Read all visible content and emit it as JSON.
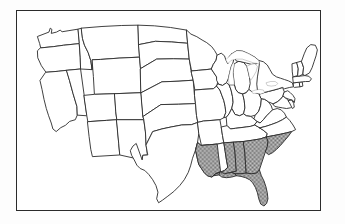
{
  "figure": {
    "type": "choropleth-outline-map",
    "title": "",
    "caption": "",
    "region": "Contiguous United States",
    "frame": {
      "visible": true,
      "border_color": "#2b2b2b",
      "background_color": "#ffffff"
    },
    "page_background_color": "#fdfdfd"
  },
  "legend": {
    "visible": false,
    "entries": []
  },
  "styles": {
    "state_fill": "#ffffff",
    "state_outline": "#2b2b2b",
    "highlight_fill_pattern": "gray-dither-halftone",
    "highlight_fill_color": "#9a9a9a",
    "lake_fill": "#ffffff"
  },
  "map": {
    "highlighted_states": [
      {
        "code": "MS",
        "name": "Mississippi"
      },
      {
        "code": "AL",
        "name": "Alabama"
      },
      {
        "code": "GA",
        "name": "Georgia"
      },
      {
        "code": "FL",
        "name": "Florida"
      },
      {
        "code": "SC",
        "name": "South Carolina"
      }
    ],
    "unhighlighted_states": [
      {
        "code": "WA",
        "name": "Washington"
      },
      {
        "code": "OR",
        "name": "Oregon"
      },
      {
        "code": "CA",
        "name": "California"
      },
      {
        "code": "NV",
        "name": "Nevada"
      },
      {
        "code": "ID",
        "name": "Idaho"
      },
      {
        "code": "MT",
        "name": "Montana"
      },
      {
        "code": "WY",
        "name": "Wyoming"
      },
      {
        "code": "UT",
        "name": "Utah"
      },
      {
        "code": "AZ",
        "name": "Arizona"
      },
      {
        "code": "CO",
        "name": "Colorado"
      },
      {
        "code": "NM",
        "name": "New Mexico"
      },
      {
        "code": "ND",
        "name": "North Dakota"
      },
      {
        "code": "SD",
        "name": "South Dakota"
      },
      {
        "code": "NE",
        "name": "Nebraska"
      },
      {
        "code": "KS",
        "name": "Kansas"
      },
      {
        "code": "OK",
        "name": "Oklahoma"
      },
      {
        "code": "TX",
        "name": "Texas"
      },
      {
        "code": "MN",
        "name": "Minnesota"
      },
      {
        "code": "IA",
        "name": "Iowa"
      },
      {
        "code": "MO",
        "name": "Missouri"
      },
      {
        "code": "AR",
        "name": "Arkansas"
      },
      {
        "code": "LA",
        "name": "Louisiana"
      },
      {
        "code": "WI",
        "name": "Wisconsin"
      },
      {
        "code": "IL",
        "name": "Illinois"
      },
      {
        "code": "MI",
        "name": "Michigan"
      },
      {
        "code": "IN",
        "name": "Indiana"
      },
      {
        "code": "OH",
        "name": "Ohio"
      },
      {
        "code": "KY",
        "name": "Kentucky"
      },
      {
        "code": "TN",
        "name": "Tennessee"
      },
      {
        "code": "WV",
        "name": "West Virginia"
      },
      {
        "code": "VA",
        "name": "Virginia"
      },
      {
        "code": "NC",
        "name": "North Carolina"
      },
      {
        "code": "PA",
        "name": "Pennsylvania"
      },
      {
        "code": "NY",
        "name": "New York"
      },
      {
        "code": "MD",
        "name": "Maryland"
      },
      {
        "code": "DE",
        "name": "Delaware"
      },
      {
        "code": "NJ",
        "name": "New Jersey"
      },
      {
        "code": "CT",
        "name": "Connecticut"
      },
      {
        "code": "RI",
        "name": "Rhode Island"
      },
      {
        "code": "MA",
        "name": "Massachusetts"
      },
      {
        "code": "VT",
        "name": "Vermont"
      },
      {
        "code": "NH",
        "name": "New Hampshire"
      },
      {
        "code": "ME",
        "name": "Maine"
      }
    ]
  }
}
